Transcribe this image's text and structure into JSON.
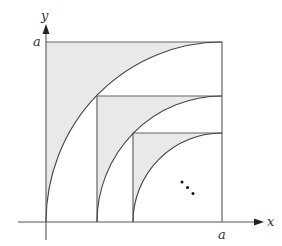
{
  "diagram": {
    "axes": {
      "x_label": "x",
      "y_label": "y",
      "x_tick_label": "a",
      "y_tick_label": "a"
    },
    "colors": {
      "shade": "#e9e9e9",
      "line": "#555555",
      "arrow": "#222222",
      "background": "#ffffff"
    },
    "squares": [
      {
        "left": 0.0,
        "side": 1.0
      },
      {
        "left": 0.29,
        "side": 0.71
      },
      {
        "left": 0.5,
        "side": 0.5
      }
    ],
    "ellipsis": "..."
  }
}
